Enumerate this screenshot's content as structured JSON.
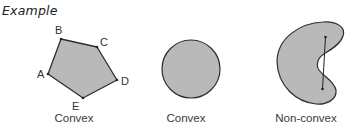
{
  "title": "Example",
  "colors": {
    "fill": "#b9b9b9",
    "stroke": "#2e2e2e",
    "text": "#333333"
  },
  "figures": [
    {
      "shape": "pentagon",
      "caption": "Convex",
      "vertices": [
        {
          "label": "A",
          "x": 48,
          "y": 74
        },
        {
          "label": "B",
          "x": 61,
          "y": 39
        },
        {
          "label": "C",
          "x": 97,
          "y": 47
        },
        {
          "label": "D",
          "x": 117,
          "y": 80
        },
        {
          "label": "E",
          "x": 83,
          "y": 98
        }
      ]
    },
    {
      "shape": "circle",
      "caption": "Convex"
    },
    {
      "shape": "kidney",
      "caption": "Non-convex",
      "chord": "line segment with endpoints inside shape that passes outside it"
    }
  ]
}
